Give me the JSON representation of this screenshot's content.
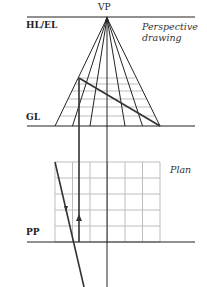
{
  "labels": {
    "vp": "VP",
    "horizon": "HL/EL",
    "ground": "GL",
    "picture_plane": "PP",
    "perspective_line1": "Perspective",
    "perspective_line2": "drawing",
    "plan": "Plan"
  },
  "colors": {
    "line": "#222222",
    "grid": "#bbbbbb"
  }
}
